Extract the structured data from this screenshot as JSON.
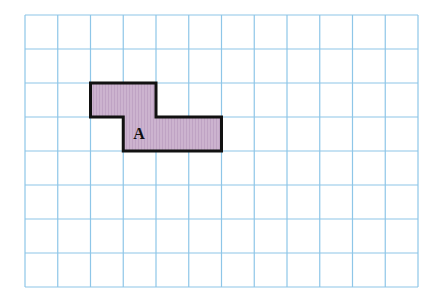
{
  "grid": {
    "left": 25,
    "top": 15,
    "cols": 12,
    "rows": 8,
    "cell_w": 32.75,
    "cell_h": 34,
    "line_color": "#8ec6e8"
  },
  "shape": {
    "name": "A",
    "fill": "#ccb3cf",
    "stroke": "#111111",
    "cells": [
      [
        2,
        2
      ],
      [
        3,
        2
      ],
      [
        3,
        3
      ],
      [
        4,
        3
      ],
      [
        5,
        3
      ]
    ],
    "outline_grid": [
      [
        2,
        2
      ],
      [
        4,
        2
      ],
      [
        4,
        3
      ],
      [
        6,
        3
      ],
      [
        6,
        4
      ],
      [
        3,
        4
      ],
      [
        3,
        3
      ],
      [
        2,
        3
      ]
    ]
  },
  "label": {
    "text": "A",
    "col": 3,
    "row": 3
  }
}
